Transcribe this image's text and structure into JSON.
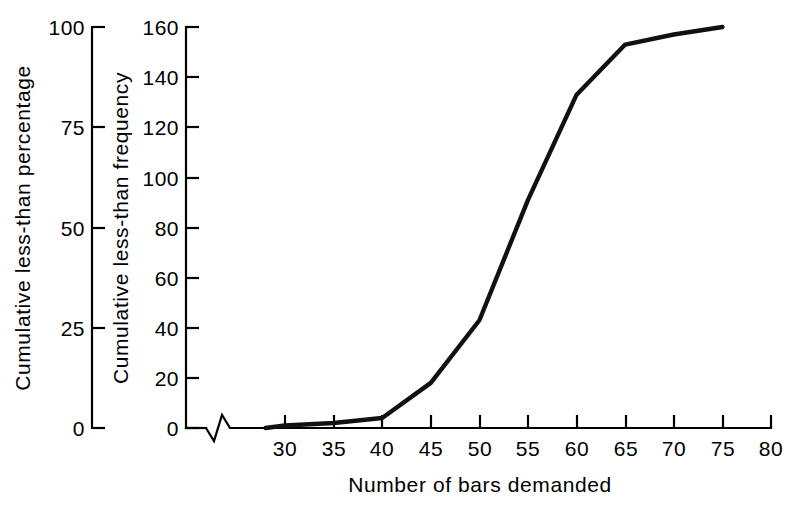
{
  "chart_data": {
    "type": "line",
    "title": "",
    "subtitle": "",
    "xlabel": "Number of bars demanded",
    "ylabel": "Cumulative less-than frequency",
    "y2label": "Cumulative less-than percentage",
    "xlim": [
      25,
      80
    ],
    "ylim": [
      0,
      160
    ],
    "y2lim": [
      0,
      100
    ],
    "grid": false,
    "legend": null,
    "axis_break": "x-axis break between origin and 30",
    "xticks": [
      30,
      35,
      40,
      45,
      50,
      55,
      60,
      65,
      70,
      75,
      80
    ],
    "xticklabels": [
      "30",
      "35",
      "40",
      "45",
      "50",
      "55",
      "60",
      "65",
      "70",
      "75",
      "80"
    ],
    "yticks": [
      0,
      20,
      40,
      60,
      80,
      100,
      120,
      140,
      160
    ],
    "yticklabels": [
      "0",
      "20",
      "40",
      "60",
      "80",
      "100",
      "120",
      "140",
      "160"
    ],
    "y2ticks": [
      0,
      25,
      50,
      75,
      100
    ],
    "y2ticklabels": [
      "0",
      "25",
      "50",
      "75",
      "100"
    ],
    "x": [
      28,
      30,
      35,
      40,
      45,
      50,
      55,
      60,
      65,
      70,
      75
    ],
    "values": [
      0,
      1,
      2,
      4,
      18,
      43,
      91,
      133,
      153,
      157,
      160
    ],
    "values_percentage": [
      0,
      0.6,
      1.3,
      2.5,
      11.3,
      26.9,
      56.9,
      83.1,
      95.6,
      98.1,
      100
    ],
    "series": [
      {
        "name": "Cumulative less-than frequency",
        "x": [
          28,
          30,
          35,
          40,
          45,
          50,
          55,
          60,
          65,
          70,
          75
        ],
        "values": [
          0,
          1,
          2,
          4,
          18,
          43,
          91,
          133,
          153,
          157,
          160
        ],
        "color": "#111111"
      }
    ]
  },
  "axes": {
    "left_axis_name": "percentage-axis",
    "inner_axis_name": "frequency-axis",
    "bottom_axis_name": "x-axis"
  },
  "colors": {
    "line": "#111111",
    "axis": "#000000",
    "background": "#ffffff"
  }
}
